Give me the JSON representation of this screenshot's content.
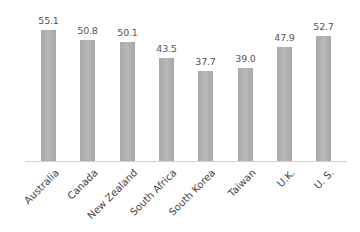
{
  "chart_data": {
    "type": "bar",
    "title": "",
    "xlabel": "",
    "ylabel": "",
    "categories": [
      "Australia",
      "Canada",
      "New Zealand",
      "South Africa",
      "South Korea",
      "Taiwan",
      "U.K.",
      "U. S."
    ],
    "values": [
      55.1,
      50.8,
      50.1,
      43.5,
      37.7,
      39.0,
      47.9,
      52.7
    ],
    "value_labels": [
      "55.1",
      "50.8",
      "50.1",
      "43.5",
      "37.7",
      "39.0",
      "47.9",
      "52.7"
    ],
    "ylim": [
      0,
      60
    ],
    "grid": false,
    "legend": null,
    "bar_color": "#b0b0b0"
  }
}
